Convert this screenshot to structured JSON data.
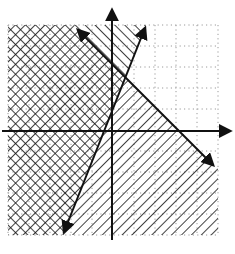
{
  "figure": {
    "type": "graph-of-system-of-linear-inequalities",
    "grid": {
      "x_range": [
        -5,
        5
      ],
      "y_range": [
        -5,
        5
      ],
      "step": 1,
      "style": "dotted",
      "color": "#999999"
    },
    "axes": {
      "x_axis": {
        "arrow": true
      },
      "y_axis": {
        "arrow": true
      },
      "tick_labels": []
    },
    "lines": [
      {
        "name": "line-1",
        "equation": "y = 2.5x",
        "from": [
          -2.3,
          -5
        ],
        "to": [
          1.6,
          5
        ],
        "arrows": "both",
        "style": "solid"
      },
      {
        "name": "line-2",
        "equation": "y = -x + 3",
        "from": [
          -1.6,
          4.6
        ],
        "to": [
          4.8,
          -1.8
        ],
        "arrows": "both",
        "style": "solid"
      }
    ],
    "shading": [
      {
        "region": "left of line-1",
        "pattern": "diagonal-hatch-forward"
      },
      {
        "region": "below line-2",
        "pattern": "diagonal-hatch-back"
      }
    ],
    "overlap_pattern": "cross-hatch",
    "colors": {
      "ink": "#111111",
      "grid_dots": "#9a9a9a",
      "background": "#ffffff"
    }
  }
}
